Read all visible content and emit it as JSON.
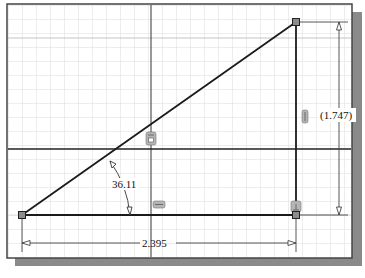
{
  "canvas": {
    "background": "#ffffff",
    "grid_color": "#d9d9d9",
    "major_grid_color": "#c8c8c8",
    "frame_color": "#333333",
    "shadow_color": "#8a8a8a",
    "axis_color": "#222222",
    "geometry_color": "#1a1a1a",
    "dimension_color": "#333333",
    "point_fill": "#8c8c8c"
  },
  "sketch": {
    "points": [
      {
        "id": "p1",
        "x": 22,
        "y": 215
      },
      {
        "id": "p2",
        "x": 296,
        "y": 22
      },
      {
        "id": "p3",
        "x": 296,
        "y": 215
      }
    ],
    "lines": [
      {
        "id": "hypotenuse",
        "from": "p1",
        "to": "p2"
      },
      {
        "id": "vertical-leg",
        "from": "p2",
        "to": "p3"
      },
      {
        "id": "horizontal-leg",
        "from": "p1",
        "to": "p3"
      }
    ]
  },
  "dimensions": {
    "horizontal": {
      "value": "2.395",
      "type": "driving"
    },
    "vertical": {
      "value": "(1.747)",
      "type": "reference"
    },
    "angle": {
      "value": "36.11",
      "unit": "deg"
    }
  },
  "constraints": [
    {
      "name": "coincident-icon",
      "target": "hypotenuse-on-y-axis"
    },
    {
      "name": "horizontal-icon",
      "target": "horizontal-leg"
    },
    {
      "name": "vertical-icon",
      "target": "vertical-leg"
    },
    {
      "name": "perpendicular-icon",
      "target": "corner-p3"
    }
  ]
}
